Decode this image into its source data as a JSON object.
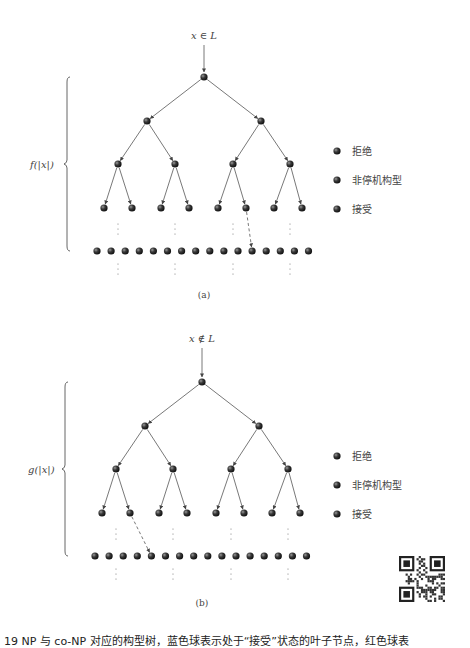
{
  "figure": {
    "panel_a": {
      "input_label": "x ∈ L",
      "brace_label": "f(|x|)",
      "sublabel": "(a)",
      "dashed_from_level4_index": 5,
      "dashed_to_leaf_index": 11
    },
    "panel_b": {
      "input_label": "x ∉ L",
      "brace_label": "g(|x|)",
      "sublabel": "(b)",
      "dashed_from_level4_index": 1,
      "dashed_to_leaf_index": 4
    },
    "legend": [
      {
        "label": "拒绝",
        "icon": "red-ball-icon",
        "color": "#3a3a3a"
      },
      {
        "label": "非停机构型",
        "icon": "dark-ball-icon",
        "color": "#2a2a2a"
      },
      {
        "label": "接受",
        "icon": "blue-ball-icon",
        "color": "#333333"
      }
    ],
    "tree": {
      "levels": 4,
      "leaf_row_count": 16
    },
    "caption": "19   NP 与 co-NP 对应的构型树，蓝色球表示处于“接受”状态的叶子节点，红色球表",
    "qr_code": "qr-code"
  }
}
